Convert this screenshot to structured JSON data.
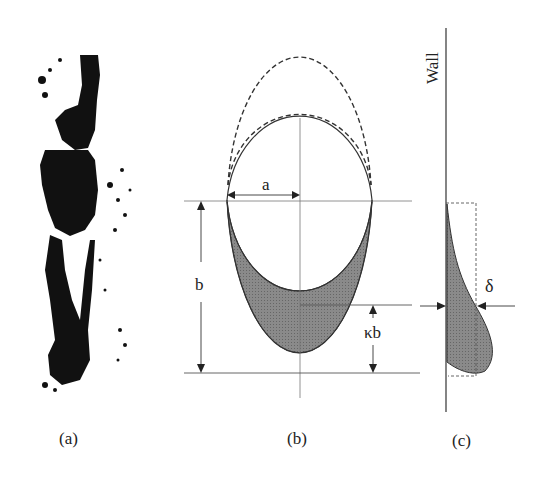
{
  "panels": {
    "a": {
      "caption": "(a)"
    },
    "b": {
      "caption": "(b)",
      "label_a": "a",
      "label_b": "b",
      "label_kb": "κb"
    },
    "c": {
      "caption": "(c)",
      "wall_label": "Wall",
      "delta_label": "δ"
    }
  },
  "colors": {
    "fill": "#7d7d7d",
    "line": "#333333",
    "thin": "#777777"
  }
}
